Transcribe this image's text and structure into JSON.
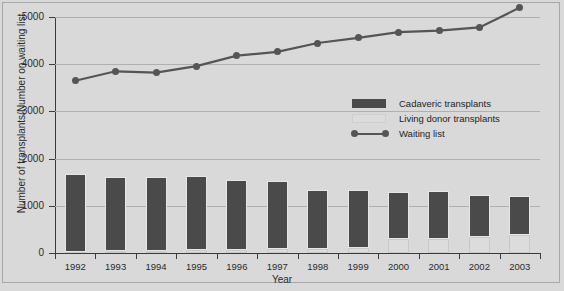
{
  "chart_data": {
    "type": "bar",
    "title": "",
    "xlabel": "Year",
    "ylabel": "Number of transplants/Number on waiting list",
    "categories": [
      "1992",
      "1993",
      "1994",
      "1995",
      "1996",
      "1997",
      "1998",
      "1999",
      "2000",
      "2001",
      "2002",
      "2003"
    ],
    "ylim": [
      0,
      5000
    ],
    "yticks": [
      0,
      1000,
      2000,
      3000,
      4000,
      5000
    ],
    "ytick_labels": [
      "0",
      "1000",
      "2000",
      "3000",
      "4000",
      "5000"
    ],
    "grid": true,
    "legend_position": "center-right inside plot",
    "series": [
      {
        "name": "Cadaveric transplants",
        "type": "bar",
        "stack": "transplants",
        "color": "#4a4a4a",
        "values": [
          1650,
          1575,
          1560,
          1580,
          1480,
          1450,
          1250,
          1230,
          1000,
          1010,
          900,
          810
        ]
      },
      {
        "name": "Living donor transplants",
        "type": "bar",
        "stack": "transplants",
        "color": "#dcdcdc",
        "values": [
          30,
          40,
          50,
          60,
          70,
          80,
          90,
          110,
          290,
          300,
          330,
          390
        ]
      },
      {
        "name": "Waiting list",
        "type": "line",
        "color": "#555555",
        "marker": "circle",
        "values": [
          3650,
          3850,
          3820,
          3960,
          4180,
          4260,
          4450,
          4560,
          4680,
          4710,
          4780,
          5200
        ]
      }
    ]
  },
  "legend": {
    "items": [
      {
        "label": "Cadaveric transplants",
        "key": "bar-dark"
      },
      {
        "label": "Living donor transplants",
        "key": "bar-light"
      },
      {
        "label": "Waiting list",
        "key": "line-marker"
      }
    ]
  }
}
